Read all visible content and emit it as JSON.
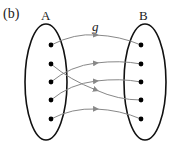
{
  "panel_label": "(b)",
  "set_a_label": "A",
  "set_b_label": "B",
  "function_label": "g",
  "set_a": {
    "elements": 5
  },
  "set_b": {
    "elements": 5
  },
  "mapping": [
    {
      "from": 1,
      "to": 1
    },
    {
      "from": 2,
      "to": 4
    },
    {
      "from": 3,
      "to": 2
    },
    {
      "from": 4,
      "to": 3
    },
    {
      "from": 5,
      "to": 5
    }
  ],
  "colors": {
    "ellipse": "#111111",
    "dot": "#000000",
    "arrow": "#888888"
  }
}
